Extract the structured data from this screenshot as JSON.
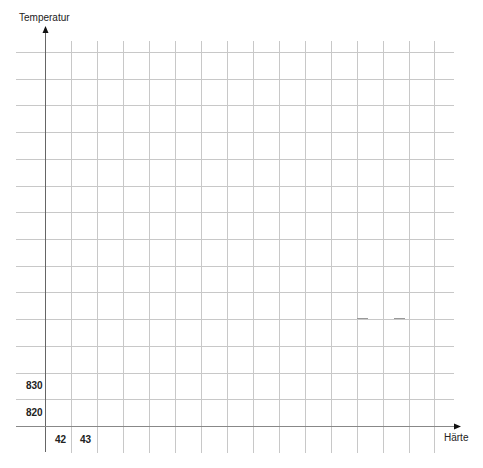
{
  "chart_data": {
    "type": "line",
    "title": "",
    "xlabel": "Härte",
    "ylabel": "Temperatur",
    "x_tick_labels": [
      "42",
      "43"
    ],
    "y_tick_labels": [
      "820",
      "830"
    ],
    "grid": true,
    "series": [],
    "grid_columns": 16,
    "grid_rows": 15,
    "note": "Empty grid worksheet; only first two ticks labelled on each axis"
  },
  "axes": {
    "x_label": "Härte",
    "y_label": "Temperatur",
    "x_ticks": [
      {
        "label": "42",
        "x": 60
      },
      {
        "label": "43",
        "x": 86
      }
    ],
    "y_ticks": [
      {
        "label": "830",
        "y": 385
      },
      {
        "label": "820",
        "y": 412
      }
    ]
  },
  "colors": {
    "grid": "#c8c8c8",
    "axis": "#555555",
    "text": "#222222"
  }
}
